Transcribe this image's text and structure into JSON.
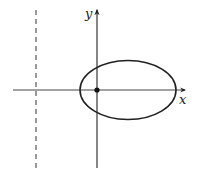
{
  "diagram": {
    "type": "ellipse-with-directrix",
    "axes": {
      "x_label": "x",
      "y_label": "y"
    },
    "elements": [
      {
        "kind": "ellipse",
        "description": "ellipse with one focus at origin, major axis along x-axis"
      },
      {
        "kind": "point",
        "description": "filled dot at origin (focus)"
      },
      {
        "kind": "dashed-line",
        "description": "vertical directrix left of origin"
      }
    ],
    "colors": {
      "stroke": "#222222",
      "background": "#ffffff"
    }
  }
}
